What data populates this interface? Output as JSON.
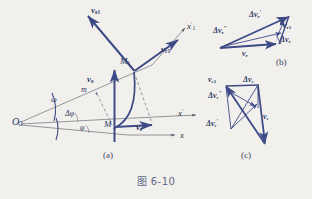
{
  "figure": {
    "caption": "图 6-10",
    "colors": {
      "vector_blue": "#3d4a86",
      "axis_gray": "#5b5f6b",
      "background": "#f2f0ed",
      "caption_gray": "#5f6a86"
    },
    "panels": [
      {
        "id": "a",
        "tag": "(a)"
      },
      {
        "id": "b",
        "tag": "(b)"
      },
      {
        "id": "c",
        "tag": "(c)"
      }
    ]
  },
  "panel_a": {
    "origin_label": "O",
    "angular_velocity": "ω",
    "delta_phi": "Δφ",
    "phi": "φ",
    "point_M": "M",
    "point_M1": "M₁",
    "point_m": "m",
    "axis_x": "x",
    "axis_x_prime": "x′",
    "axis_x1_prime": "x′₁",
    "vector_ve": "ve",
    "vector_ve1": "ve1",
    "vector_vr": "vr",
    "vector_vr1": "vr1"
  },
  "panel_b": {
    "vector_vr": "vr",
    "vector_vr1": "vr1",
    "delta_vr_prime": "Δvr′",
    "delta_vr_dprime": "Δvr″",
    "delta_vr": "Δvr"
  },
  "panel_c": {
    "vector_ve": "ve",
    "vector_ve1": "ve1",
    "delta_ve": "Δve",
    "delta_ve_prime": "Δve′",
    "delta_ve_dprime": "Δve″"
  }
}
